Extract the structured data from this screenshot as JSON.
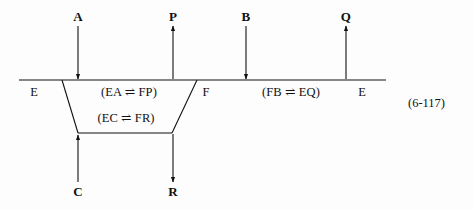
{
  "figure": {
    "kind": "enzyme-kinetics-reaction-scheme",
    "equation_number": "(6-117)",
    "line_color": "#111111",
    "background_color": "#fdfdfd",
    "text_color": "#111111"
  },
  "species_labels": {
    "top": [
      {
        "id": "A",
        "text": "A",
        "x": 78,
        "y": 16,
        "arrow": "down"
      },
      {
        "id": "P",
        "text": "P",
        "x": 173,
        "y": 16,
        "arrow": "up"
      },
      {
        "id": "B",
        "text": "B",
        "x": 246,
        "y": 16,
        "arrow": "down"
      },
      {
        "id": "Q",
        "text": "Q",
        "x": 346,
        "y": 16,
        "arrow": "up"
      }
    ],
    "bottom": [
      {
        "id": "C",
        "text": "C",
        "x": 78,
        "y": 191,
        "arrow": "up"
      },
      {
        "id": "R",
        "text": "R",
        "x": 173,
        "y": 191,
        "arrow": "down"
      }
    ]
  },
  "enzyme_states": [
    {
      "id": "E-left",
      "text": "E",
      "x": 34,
      "y": 93
    },
    {
      "id": "F-middle",
      "text": "F",
      "x": 206,
      "y": 93
    },
    {
      "id": "E-right",
      "text": "E",
      "x": 362,
      "y": 93
    }
  ],
  "complexes": [
    {
      "id": "EA-FP",
      "text": "(EA ⇌ FP)",
      "x": 129,
      "y": 93,
      "left": "EA",
      "right": "FP",
      "arrow": "equilibrium"
    },
    {
      "id": "FB-EQ",
      "text": "(FB ⇌ EQ)",
      "x": 291,
      "y": 93,
      "left": "FB",
      "right": "EQ",
      "arrow": "equilibrium"
    },
    {
      "id": "EC-FR",
      "text": "(EC ⇌ FR)",
      "x": 126,
      "y": 119,
      "left": "EC",
      "right": "FR",
      "arrow": "equilibrium"
    }
  ],
  "arrows": {
    "A_down": {
      "x": 78,
      "y1": 26,
      "y2": 79,
      "head": "end"
    },
    "P_up": {
      "x": 173,
      "y1": 79,
      "y2": 26,
      "head": "end"
    },
    "B_down": {
      "x": 246,
      "y1": 26,
      "y2": 79,
      "head": "end"
    },
    "Q_up": {
      "x": 346,
      "y1": 79,
      "y2": 26,
      "head": "end"
    },
    "C_up": {
      "x": 78,
      "y1": 182,
      "y2": 134,
      "head": "end"
    },
    "R_down": {
      "x": 173,
      "y1": 134,
      "y2": 182,
      "head": "end"
    }
  },
  "baseline": {
    "x1": 19,
    "x2": 386,
    "y": 80
  },
  "trapezoid": {
    "top_left": {
      "x": 62,
      "y": 80
    },
    "top_right": {
      "x": 197,
      "y": 80
    },
    "bottom_left": {
      "x": 78,
      "y": 133
    },
    "bottom_right": {
      "x": 172,
      "y": 133
    }
  }
}
